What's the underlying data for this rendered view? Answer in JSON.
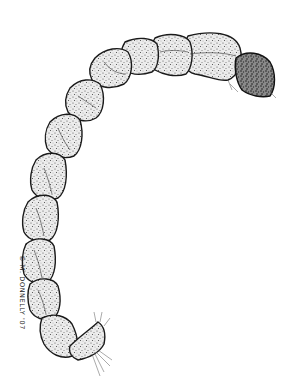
{
  "illustration": {
    "subject": "larva-stipple-drawing",
    "signature": "© M. DONNELLY '07",
    "colors": {
      "ink": "#1a1a1a",
      "background": "#ffffff"
    }
  }
}
